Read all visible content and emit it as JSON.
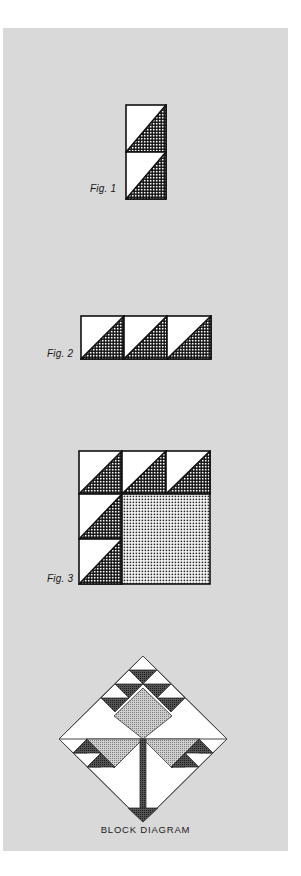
{
  "figures": {
    "fig1": {
      "label": "Fig. 1",
      "description": "Two stacked half-square triangle units, lower-right triangles cross-hatched"
    },
    "fig2": {
      "label": "Fig. 2",
      "description": "Three half-square triangle units in a row"
    },
    "fig3": {
      "label": "Fig. 3",
      "description": "Three-by-three block: top row and left column of triangle units, large dotted square in lower-right"
    },
    "block": {
      "caption": "BLOCK DIAGRAM",
      "description": "Tree-of-life style block set on point with triangle units, stippled squares and trunk"
    }
  },
  "colors": {
    "panel_bg": "#d9d9d9",
    "page_bg": "#ffffff",
    "ink": "#111111",
    "light_fill": "#ffffff",
    "stipple_fill": "#b8b8b8",
    "dark_triangle": "#3a3a3a"
  }
}
